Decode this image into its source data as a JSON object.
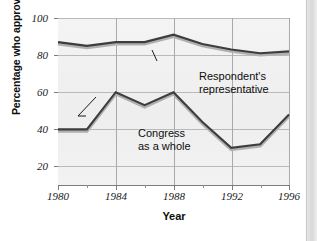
{
  "chart_data": {
    "type": "line",
    "title": "",
    "subtitle": "",
    "xlabel": "Year",
    "ylabel": "Percentage who approve",
    "xlim": [
      1980,
      1996
    ],
    "ylim": [
      10,
      100
    ],
    "xticks": [
      1980,
      1984,
      1988,
      1992,
      1996
    ],
    "xtick_labels": [
      "1980",
      "1984",
      "1988",
      "1992",
      "1996"
    ],
    "xticks_minor": [
      1982,
      1986,
      1990,
      1994
    ],
    "yticks": [
      20,
      40,
      60,
      80,
      100
    ],
    "ytick_labels": [
      "20",
      "40",
      "60",
      "80",
      "100"
    ],
    "grid": true,
    "legend": "none (inline annotations)",
    "x": [
      1980,
      1982,
      1984,
      1986,
      1988,
      1990,
      1992,
      1994,
      1996
    ],
    "series": [
      {
        "name": "Respondent's representative",
        "values": [
          87,
          85,
          87,
          87,
          91,
          86,
          83,
          81,
          82
        ],
        "color": "#3d3d3d"
      },
      {
        "name": "Congress as a whole",
        "values": [
          40,
          40,
          60,
          53,
          60,
          44,
          30,
          32,
          48
        ],
        "color": "#3d3d3d"
      }
    ],
    "annotations": [
      {
        "name": "respondent-annotation",
        "line1": "Respondent's",
        "line2": "representative"
      },
      {
        "name": "congress-annotation",
        "line1": "Congress",
        "line2": "as a whole"
      }
    ],
    "colors": {
      "plot_background": "#f1f1f1",
      "gridline": "#b9b9b9",
      "axis": "#7c7c7c",
      "line_dark": "#3d3d3d",
      "line_highlight": "#a8a8a8",
      "text": "#0d0d0d"
    }
  }
}
